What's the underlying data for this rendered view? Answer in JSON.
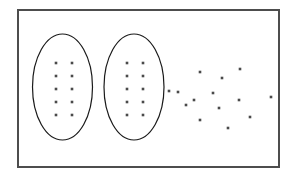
{
  "figure": {
    "background_color": "#ffffff",
    "frame": {
      "name": "outer-frame",
      "x": 18,
      "y": 10,
      "width": 261,
      "height": 157,
      "stroke_color": "#4d4d4d",
      "stroke_width": 2,
      "fill": "none"
    },
    "clusters": [
      {
        "name": "left-cluster",
        "label": "Cluster 1",
        "shape": "ellipse",
        "outline": {
          "cx": 62.5,
          "cy": 87,
          "rx": 30,
          "ry": 53,
          "stroke_color": "#1a1a1a",
          "stroke_width": 1.2,
          "fill": "none"
        },
        "point_count": 10,
        "point_layout": "grid-2x5",
        "points": [
          {
            "x": 56,
            "y": 63
          },
          {
            "x": 72,
            "y": 63
          },
          {
            "x": 56,
            "y": 76
          },
          {
            "x": 72,
            "y": 76
          },
          {
            "x": 56,
            "y": 89
          },
          {
            "x": 72,
            "y": 89
          },
          {
            "x": 56,
            "y": 102
          },
          {
            "x": 72,
            "y": 102
          },
          {
            "x": 56,
            "y": 115
          },
          {
            "x": 72,
            "y": 115
          }
        ]
      },
      {
        "name": "middle-cluster",
        "label": "Cluster 2",
        "shape": "ellipse",
        "outline": {
          "cx": 134,
          "cy": 87,
          "rx": 30,
          "ry": 53,
          "stroke_color": "#1a1a1a",
          "stroke_width": 1.2,
          "fill": "none"
        },
        "point_count": 10,
        "point_layout": "grid-2x5",
        "points": [
          {
            "x": 127,
            "y": 63
          },
          {
            "x": 143,
            "y": 63
          },
          {
            "x": 127,
            "y": 76
          },
          {
            "x": 143,
            "y": 76
          },
          {
            "x": 127,
            "y": 89
          },
          {
            "x": 143,
            "y": 89
          },
          {
            "x": 127,
            "y": 102
          },
          {
            "x": 143,
            "y": 102
          },
          {
            "x": 127,
            "y": 115
          },
          {
            "x": 143,
            "y": 115
          }
        ]
      },
      {
        "name": "scatter-group",
        "label": "Unclustered points",
        "shape": "none",
        "outline": null,
        "point_count": 14,
        "point_layout": "scattered",
        "points": [
          {
            "x": 169,
            "y": 91
          },
          {
            "x": 200,
            "y": 72
          },
          {
            "x": 222,
            "y": 78
          },
          {
            "x": 240,
            "y": 69
          },
          {
            "x": 178,
            "y": 92
          },
          {
            "x": 213,
            "y": 93
          },
          {
            "x": 194,
            "y": 100
          },
          {
            "x": 239,
            "y": 100
          },
          {
            "x": 271,
            "y": 97
          },
          {
            "x": 219,
            "y": 108
          },
          {
            "x": 200,
            "y": 120
          },
          {
            "x": 250,
            "y": 117
          },
          {
            "x": 228,
            "y": 128
          },
          {
            "x": 186,
            "y": 105
          }
        ]
      }
    ],
    "point_style": {
      "color": "#4a4a4a",
      "size": 2.6,
      "shape": "square"
    }
  }
}
